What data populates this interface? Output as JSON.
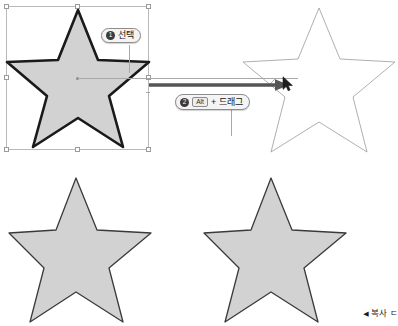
{
  "canvas": {
    "width": 398,
    "height": 326,
    "background": "#ffffff"
  },
  "colors": {
    "star_fill": "#d2d2d2",
    "star_stroke_thick": "#1a1a1a",
    "star_stroke_thin": "#3a3a3a",
    "ghost_stroke": "#9b9b9b",
    "selection_border": "#b9b9b9",
    "handle_fill": "#ffffff",
    "handle_border": "#9a9a9a",
    "arrow": "#555555",
    "guide_line": "#a8a8a8",
    "badge_bg": "#3b3b3b",
    "callout_bg": "#f4f4f4",
    "callout_border": "#8d8d8d",
    "text": "#161616"
  },
  "shapes": {
    "selected_star": {
      "name": "selected-star",
      "state": "selected",
      "fill": "#d2d2d2",
      "stroke": "#1a1a1a",
      "stroke_width": 2.6
    },
    "ghost_star": {
      "name": "ghost-preview-star",
      "state": "drag-preview",
      "fill": "none",
      "stroke": "#9b9b9b",
      "stroke_width": 0.8
    },
    "result_star_left": {
      "name": "result-star-original",
      "fill": "#d2d2d2",
      "stroke": "#3a3a3a",
      "stroke_width": 1.2
    },
    "result_star_right": {
      "name": "result-star-copy",
      "fill": "#d2d2d2",
      "stroke": "#3a3a3a",
      "stroke_width": 1.2
    }
  },
  "selection": {
    "handle_count": 8,
    "handles": [
      "top-left",
      "top-center",
      "top-right",
      "middle-left",
      "middle-right",
      "bottom-left",
      "bottom-center",
      "bottom-right"
    ]
  },
  "callouts": {
    "step1": {
      "badge": "❶",
      "number": "1",
      "text": "선택"
    },
    "step2": {
      "badge": "❷",
      "number": "2",
      "key": "Alt",
      "plus": "+",
      "text": "드래그"
    }
  },
  "caption": {
    "marker": "◀",
    "text": "복사 ㄷ"
  },
  "icons": {
    "cursor": "mouse-pointer-icon",
    "drag_arrow": "drag-arrow-icon"
  }
}
